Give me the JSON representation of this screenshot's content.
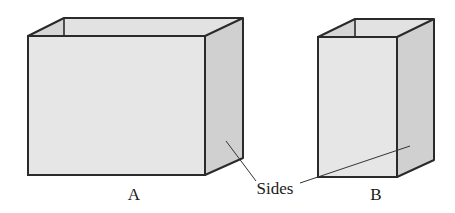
{
  "diagram": {
    "boxes": [
      {
        "id": "A",
        "label": "A"
      },
      {
        "id": "B",
        "label": "B"
      }
    ],
    "callout": {
      "label": "Sides"
    },
    "colors": {
      "stroke": "#2a2a2a",
      "front_face": "#e6e6e6",
      "side_face": "#d2d2d2",
      "inner_face": "#dadada",
      "background": "#ffffff"
    }
  }
}
